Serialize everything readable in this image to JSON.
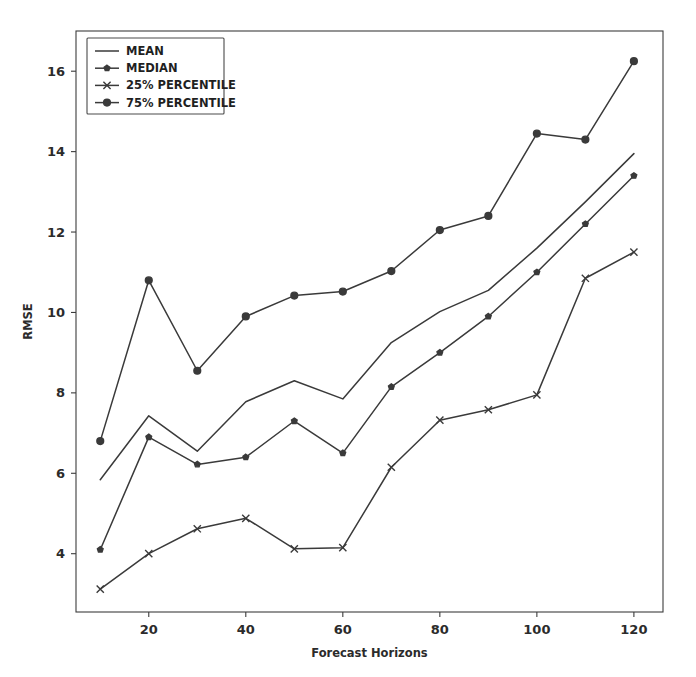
{
  "chart_data": {
    "type": "line",
    "title": "",
    "xlabel": "Forecast Horizons",
    "ylabel": "RMSE",
    "x": [
      10,
      20,
      30,
      40,
      50,
      60,
      70,
      80,
      90,
      100,
      110,
      120
    ],
    "xlim": [
      5,
      126
    ],
    "ylim": [
      2.55,
      17.0
    ],
    "xticks": [
      20,
      40,
      60,
      80,
      100,
      120
    ],
    "yticks": [
      4,
      6,
      8,
      10,
      12,
      14,
      16
    ],
    "grid": false,
    "legend_position": "upper left",
    "series": [
      {
        "name": "MEAN",
        "marker": "none",
        "values": [
          5.84,
          7.43,
          6.55,
          7.78,
          8.3,
          7.85,
          9.25,
          10.02,
          10.55,
          11.6,
          12.75,
          13.95
        ]
      },
      {
        "name": "MEDIAN",
        "marker": "star",
        "values": [
          4.1,
          6.9,
          6.22,
          6.4,
          7.3,
          6.5,
          8.15,
          9.0,
          9.9,
          11.0,
          12.2,
          13.4
        ]
      },
      {
        "name": "25% PERCENTILE",
        "marker": "x",
        "values": [
          3.12,
          4.0,
          4.62,
          4.88,
          4.12,
          4.15,
          6.15,
          7.32,
          7.58,
          7.95,
          10.85,
          11.5
        ]
      },
      {
        "name": "75% PERCENTILE",
        "marker": "circle",
        "values": [
          6.8,
          10.8,
          8.55,
          9.9,
          10.42,
          10.52,
          11.03,
          12.05,
          12.4,
          14.45,
          14.3,
          16.25
        ]
      }
    ]
  },
  "axes": {
    "x_tick_labels": [
      "20",
      "40",
      "60",
      "80",
      "100",
      "120"
    ],
    "y_tick_labels": [
      "4",
      "6",
      "8",
      "10",
      "12",
      "14",
      "16"
    ],
    "x_axis_title": "Forecast Horizons",
    "y_axis_title": "RMSE"
  },
  "legend": {
    "entries": [
      {
        "label": "MEAN",
        "marker": "none"
      },
      {
        "label": "MEDIAN",
        "marker": "star"
      },
      {
        "label": "25% PERCENTILE",
        "marker": "x"
      },
      {
        "label": "75% PERCENTILE",
        "marker": "circle"
      }
    ]
  },
  "colors": {
    "line": "#3a3a3a",
    "axis": "#3c3c3c",
    "text": "#2b2b2b",
    "background": "#ffffff"
  }
}
